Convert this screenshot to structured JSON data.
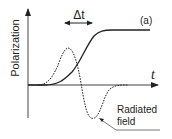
{
  "figure": {
    "panel_label": "(a)",
    "y_axis_label": "Polarization",
    "x_axis_label": "t",
    "delta_label": "Δt",
    "annotation": {
      "line1": "Radiated",
      "line2": "field"
    },
    "curves": [
      {
        "name": "polarization",
        "style": "solid",
        "shape": "sigmoid step rising from baseline to plateau"
      },
      {
        "name": "radiated-field",
        "style": "dotted",
        "shape": "positive peak followed by negative trough (derivative of polarization)"
      }
    ],
    "colors": {
      "line": "#222222",
      "background": "#ffffff"
    }
  }
}
